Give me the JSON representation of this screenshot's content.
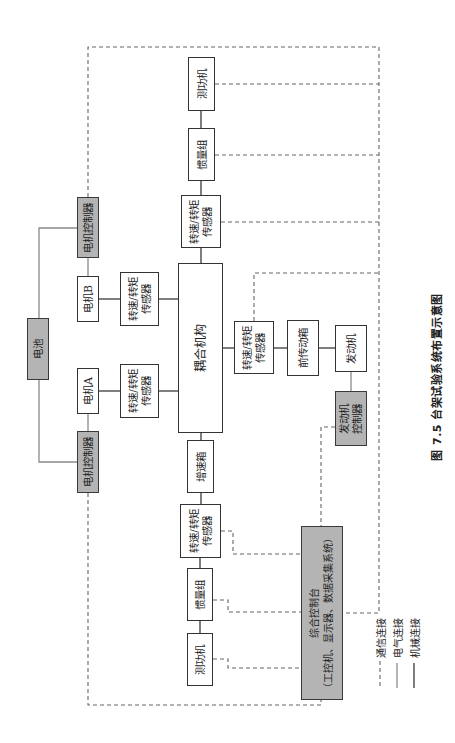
{
  "diagram": {
    "caption": "图 7.5   台架试验系统布置示意图",
    "colors": {
      "controller_fill": "#b4b4b4",
      "border": "#333333",
      "mechanical_line": "#3a3a3a",
      "electrical_line": "#8a8a8a",
      "communication_line": "#666666"
    },
    "nodes": [
      {
        "id": "dyno-top",
        "label": "测功机"
      },
      {
        "id": "inertia-top",
        "label": "惯量组"
      },
      {
        "id": "sensor-top",
        "lines": [
          "转速/转矩",
          "传感器"
        ]
      },
      {
        "id": "motor-controller-top",
        "label": "电机控制器"
      },
      {
        "id": "battery",
        "label": "电池"
      },
      {
        "id": "motor-b",
        "label": "电机B"
      },
      {
        "id": "sensor-b",
        "lines": [
          "转速/转矩",
          "传感器"
        ]
      },
      {
        "id": "motor-a",
        "label": "电机A"
      },
      {
        "id": "sensor-a",
        "lines": [
          "转速/转矩",
          "传感器"
        ]
      },
      {
        "id": "coupling",
        "label": "耦合机构"
      },
      {
        "id": "motor-controller-bottom",
        "label": "电机控制器"
      },
      {
        "id": "gearbox",
        "label": "增速箱"
      },
      {
        "id": "sensor-bottom",
        "lines": [
          "转速/转矩",
          "传感器"
        ]
      },
      {
        "id": "inertia-bottom",
        "label": "惯量组"
      },
      {
        "id": "dyno-bottom",
        "label": "测功机"
      },
      {
        "id": "sensor-right",
        "lines": [
          "转速/转矩",
          "传感器"
        ]
      },
      {
        "id": "front-transmission",
        "label": "前传动箱"
      },
      {
        "id": "engine",
        "label": "发动机"
      },
      {
        "id": "engine-controller",
        "lines": [
          "发动机",
          "控制器"
        ]
      },
      {
        "id": "console",
        "lines": [
          "综合控制台",
          "（工控机、显示器、数据采集系统）"
        ]
      }
    ],
    "legend": [
      {
        "label": "通信连接",
        "style": "dashed"
      },
      {
        "label": "电气连接",
        "style": "solid-gray"
      },
      {
        "label": "机械连接",
        "style": "solid-black"
      }
    ]
  }
}
